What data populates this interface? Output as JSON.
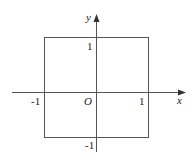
{
  "diagram": {
    "type": "coordinate-plane-square",
    "axes": {
      "x_label": "x",
      "y_label": "y",
      "origin_label": "O"
    },
    "ticks": {
      "x_pos": "1",
      "x_neg": "-1",
      "y_pos": "1",
      "y_neg": "-1"
    },
    "square": {
      "vertices": [
        [
          -1,
          1
        ],
        [
          1,
          1
        ],
        [
          1,
          -1
        ],
        [
          -1,
          -1
        ]
      ]
    },
    "colors": {
      "stroke": "#555555",
      "text": "#222222"
    }
  }
}
